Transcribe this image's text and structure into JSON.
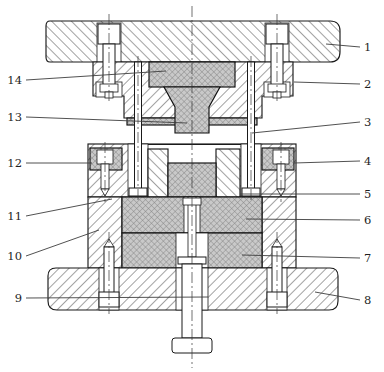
{
  "drawing": {
    "name": "die-assembly-section",
    "kind": "sectional technical drawing",
    "callout_count": 14
  },
  "colors": {
    "background": "#ffffff",
    "outline": "#1a1a1a",
    "hatch_line": "#454545",
    "dark_part_fill": "#c9c9c9",
    "dark_part_hatch": "#858585",
    "leader": "#3d3d3d",
    "label": "#1f1f1f"
  },
  "callouts": [
    {
      "label": "1",
      "side": "right",
      "label_x": 364,
      "label_y": 47,
      "target_x": 326,
      "target_y": 44
    },
    {
      "label": "2",
      "side": "right",
      "label_x": 364,
      "label_y": 84,
      "target_x": 294,
      "target_y": 82
    },
    {
      "label": "3",
      "side": "right",
      "label_x": 364,
      "label_y": 122,
      "target_x": 252,
      "target_y": 133
    },
    {
      "label": "4",
      "side": "right",
      "label_x": 364,
      "label_y": 161,
      "target_x": 294,
      "target_y": 163
    },
    {
      "label": "5",
      "side": "right",
      "label_x": 364,
      "label_y": 194,
      "target_x": 240,
      "target_y": 194
    },
    {
      "label": "6",
      "side": "right",
      "label_x": 364,
      "label_y": 220,
      "target_x": 246,
      "target_y": 219
    },
    {
      "label": "7",
      "side": "right",
      "label_x": 364,
      "label_y": 258,
      "target_x": 242,
      "target_y": 255
    },
    {
      "label": "8",
      "side": "right",
      "label_x": 364,
      "label_y": 300,
      "target_x": 315,
      "target_y": 292
    },
    {
      "label": "9",
      "side": "left",
      "label_x": 22,
      "label_y": 298,
      "target_x": 208,
      "target_y": 297
    },
    {
      "label": "10",
      "side": "left",
      "label_x": 22,
      "label_y": 256,
      "target_x": 99,
      "target_y": 230
    },
    {
      "label": "11",
      "side": "left",
      "label_x": 22,
      "label_y": 216,
      "target_x": 112,
      "target_y": 199
    },
    {
      "label": "12",
      "side": "left",
      "label_x": 22,
      "label_y": 163,
      "target_x": 92,
      "target_y": 163
    },
    {
      "label": "13",
      "side": "left",
      "label_x": 22,
      "label_y": 117,
      "target_x": 187,
      "target_y": 123
    },
    {
      "label": "14",
      "side": "left",
      "label_x": 22,
      "label_y": 80,
      "target_x": 166,
      "target_y": 71
    }
  ]
}
